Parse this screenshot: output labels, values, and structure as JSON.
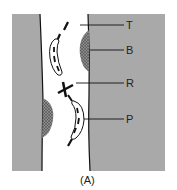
{
  "figure": {
    "caption": "(A)",
    "labels": [
      {
        "key": "T",
        "text": "T"
      },
      {
        "key": "B",
        "text": "B"
      },
      {
        "key": "R",
        "text": "R"
      },
      {
        "key": "P",
        "text": "P"
      }
    ]
  },
  "colors": {
    "tissue": "#a9a9a9",
    "lumen": "#ffffff",
    "stipple": "#555555",
    "line": "#111111"
  }
}
